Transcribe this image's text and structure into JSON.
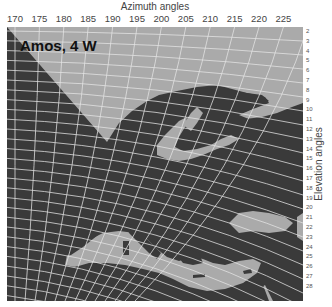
{
  "map": {
    "satellite_label": "Amos, 4 W",
    "x_axis": {
      "title": "Azimuth angles",
      "ticks": [
        {
          "label": "170",
          "x": 15
        },
        {
          "label": "175",
          "x": 51
        },
        {
          "label": "180",
          "x": 87
        },
        {
          "label": "185",
          "x": 122
        },
        {
          "label": "190",
          "x": 158
        },
        {
          "label": "195",
          "x": 193
        },
        {
          "label": "200",
          "x": 229
        },
        {
          "label": "205",
          "x": 264
        },
        {
          "label": "210",
          "x": 300
        },
        {
          "label": "215",
          "x": 336
        },
        {
          "label": "220",
          "x": 371
        },
        {
          "label": "225",
          "x": 406
        }
      ]
    },
    "y_axis": {
      "title": "Elevation angles",
      "ticks": [
        "2",
        "3",
        "4",
        "5",
        "6",
        "7",
        "8",
        "9",
        "10",
        "11",
        "12",
        "13",
        "14",
        "15",
        "16",
        "17",
        "18",
        "19",
        "20",
        "21",
        "22",
        "23",
        "24",
        "25",
        "26",
        "27",
        "28"
      ]
    },
    "colors": {
      "sea": "#aaaaaa",
      "land": "#3a3a3a",
      "grid": "#e6e6e6",
      "background": "#ffffff"
    }
  }
}
